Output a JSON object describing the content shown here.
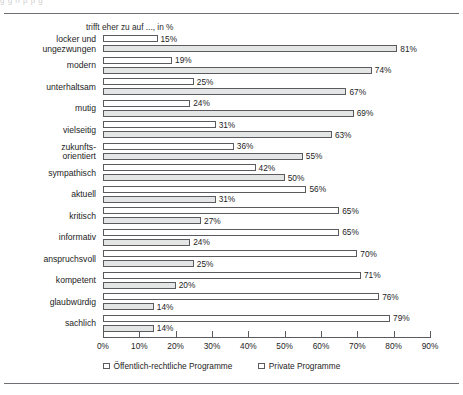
{
  "figure": {
    "ghost_text": "ḡ                        ḡ       ṅ                                                    p                        p  g",
    "title": "trifft eher zu auf ..., in %"
  },
  "axis": {
    "ticks": [
      "0%",
      "10%",
      "20%",
      "30%",
      "40%",
      "50%",
      "60%",
      "70%",
      "80%",
      "90%"
    ],
    "min": 0,
    "max": 90,
    "step": 10
  },
  "legend": {
    "items": [
      {
        "label": "Öffentlich-rechtliche Programme",
        "swatch": "white-square-icon"
      },
      {
        "label": "Private Programme",
        "swatch": "white-square-icon"
      }
    ]
  },
  "chart_data": {
    "type": "bar",
    "orientation": "horizontal",
    "title": "trifft eher zu auf ..., in %",
    "xlabel": "",
    "ylabel": "",
    "xlim": [
      0,
      90
    ],
    "grid": false,
    "legend_position": "bottom",
    "categories": [
      "locker und ungezwungen",
      "modern",
      "unterhaltsam",
      "mutig",
      "vielseitig",
      "zukunfts-orientiert",
      "sympathisch",
      "aktuell",
      "kritisch",
      "informativ",
      "anspruchsvoll",
      "kompetent",
      "glaubwürdig",
      "sachlich"
    ],
    "series": [
      {
        "name": "Öffentlich-rechtliche Programme",
        "values": [
          15,
          19,
          25,
          24,
          31,
          36,
          42,
          56,
          65,
          65,
          70,
          71,
          76,
          79
        ]
      },
      {
        "name": "Private Programme",
        "values": [
          81,
          74,
          67,
          69,
          63,
          55,
          50,
          31,
          27,
          24,
          25,
          20,
          14,
          14
        ]
      }
    ]
  },
  "rows": [
    {
      "label_lines": [
        "locker und",
        "ungezwungen"
      ],
      "pub": 15,
      "priv": 81,
      "pub_text": "15%",
      "priv_text": "81%"
    },
    {
      "label_lines": [
        "modern"
      ],
      "pub": 19,
      "priv": 74,
      "pub_text": "19%",
      "priv_text": "74%"
    },
    {
      "label_lines": [
        "unterhaltsam"
      ],
      "pub": 25,
      "priv": 67,
      "pub_text": "25%",
      "priv_text": "67%"
    },
    {
      "label_lines": [
        "mutig"
      ],
      "pub": 24,
      "priv": 69,
      "pub_text": "24%",
      "priv_text": "69%"
    },
    {
      "label_lines": [
        "vielseitig"
      ],
      "pub": 31,
      "priv": 63,
      "pub_text": "31%",
      "priv_text": "63%"
    },
    {
      "label_lines": [
        "zukunfts-",
        "orientiert"
      ],
      "pub": 36,
      "priv": 55,
      "pub_text": "36%",
      "priv_text": "55%"
    },
    {
      "label_lines": [
        "sympathisch"
      ],
      "pub": 42,
      "priv": 50,
      "pub_text": "42%",
      "priv_text": "50%"
    },
    {
      "label_lines": [
        "aktuell"
      ],
      "pub": 56,
      "priv": 31,
      "pub_text": "56%",
      "priv_text": "31%"
    },
    {
      "label_lines": [
        "kritisch"
      ],
      "pub": 65,
      "priv": 27,
      "pub_text": "65%",
      "priv_text": "27%"
    },
    {
      "label_lines": [
        "informativ"
      ],
      "pub": 65,
      "priv": 24,
      "pub_text": "65%",
      "priv_text": "24%"
    },
    {
      "label_lines": [
        "anspruchsvoll"
      ],
      "pub": 70,
      "priv": 25,
      "pub_text": "70%",
      "priv_text": "25%"
    },
    {
      "label_lines": [
        "kompetent"
      ],
      "pub": 71,
      "priv": 20,
      "pub_text": "71%",
      "priv_text": "20%"
    },
    {
      "label_lines": [
        "glaubwürdig"
      ],
      "pub": 76,
      "priv": 14,
      "pub_text": "76%",
      "priv_text": "14%"
    },
    {
      "label_lines": [
        "sachlich"
      ],
      "pub": 79,
      "priv": 14,
      "pub_text": "79%",
      "priv_text": "14%"
    }
  ],
  "colors": {
    "public_fill": "#ffffff",
    "private_fill": "#e3e6e4",
    "bar_stroke": "#5a5a5f",
    "rule": "#6e6e74",
    "text": "#1d1d1d"
  }
}
